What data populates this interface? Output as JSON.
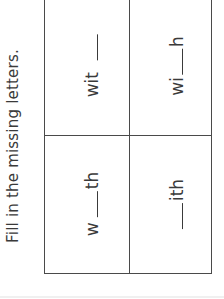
{
  "worksheet": {
    "instruction": "Fill in the missing letters.",
    "cells": [
      {
        "position": "top-left",
        "prefix": "wit",
        "suffix": "",
        "display": "wit ___"
      },
      {
        "position": "top-right",
        "prefix": "wi",
        "suffix": "h",
        "display": "wi___h"
      },
      {
        "position": "bottom-left",
        "prefix": "w",
        "suffix": "th",
        "display": "w___th"
      },
      {
        "position": "bottom-right",
        "prefix": "",
        "suffix": "ith",
        "display": "___ith"
      }
    ],
    "colors": {
      "text": "#3a3a3a",
      "grid_lines": "#4a4a4a",
      "background": "#ffffff"
    }
  }
}
